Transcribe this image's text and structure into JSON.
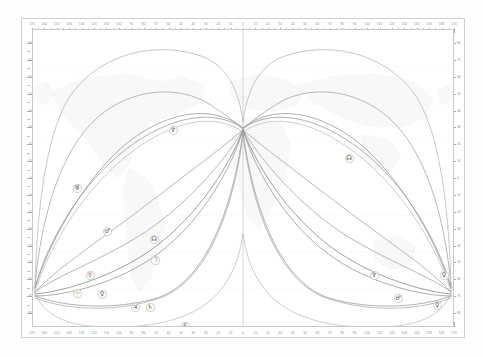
{
  "chart": {
    "type": "astrocartography-map",
    "projection": "equirectangular"
  },
  "axes": {
    "x_label_unit": "degrees longitude",
    "y_label_unit": "degrees latitude",
    "longitude_ticks": [
      "170",
      "160",
      "150",
      "140",
      "130",
      "120",
      "110",
      "100",
      "90",
      "80",
      "70",
      "60",
      "50",
      "40",
      "30",
      "20",
      "10",
      "0",
      "10",
      "20",
      "30",
      "40",
      "50",
      "60",
      "70",
      "80",
      "90",
      "100",
      "110",
      "120",
      "130",
      "140",
      "150",
      "160",
      "170"
    ],
    "latitude_ticks": [
      "80",
      "70",
      "60",
      "50",
      "40",
      "30",
      "20",
      "10",
      "0",
      "10",
      "20",
      "30",
      "40",
      "50",
      "60",
      "70",
      "80"
    ],
    "center_meridian": "0"
  },
  "side_captions": {
    "left": "",
    "bottom_left": ""
  },
  "planets": [
    {
      "key": "sun",
      "name": "Sun",
      "glyph": "☉",
      "color": "#8a8a8a"
    },
    {
      "key": "moon",
      "name": "Moon",
      "glyph": "☽",
      "color": "#9a9a9a"
    },
    {
      "key": "mercury",
      "name": "Mercury",
      "glyph": "☿",
      "color": "#909090"
    },
    {
      "key": "venus",
      "name": "Venus",
      "glyph": "♀",
      "color": "#8e8e8e"
    },
    {
      "key": "mars",
      "name": "Mars",
      "glyph": "♂",
      "color": "#8b8b8b"
    },
    {
      "key": "jupiter",
      "name": "Jupiter",
      "glyph": "♃",
      "color": "#949494"
    },
    {
      "key": "saturn",
      "name": "Saturn",
      "glyph": "♄",
      "color": "#8f8f8f"
    },
    {
      "key": "uranus",
      "name": "Uranus",
      "glyph": "♅",
      "color": "#a2a2a2"
    },
    {
      "key": "neptune",
      "name": "Neptune",
      "glyph": "♆",
      "color": "#999999"
    },
    {
      "key": "pluto",
      "name": "Pluto",
      "glyph": "♇",
      "color": "#a6a6a6"
    },
    {
      "key": "node",
      "name": "North Node",
      "glyph": "☊",
      "color": "#979797"
    }
  ],
  "markers": [
    {
      "id": "m01",
      "planet": "Neptune",
      "glyph": "♆",
      "x": 140,
      "y": 100,
      "side": "west"
    },
    {
      "id": "m02",
      "planet": "Uranus",
      "glyph": "♅",
      "x": 44,
      "y": 158,
      "side": "west"
    },
    {
      "id": "m03",
      "planet": "Mars",
      "glyph": "♂",
      "x": 74,
      "y": 201,
      "side": "west"
    },
    {
      "id": "m04",
      "planet": "North Node",
      "glyph": "☊",
      "x": 121,
      "y": 209,
      "side": "west"
    },
    {
      "id": "m05",
      "planet": "Moon",
      "glyph": "☽",
      "x": 122,
      "y": 230,
      "side": "west"
    },
    {
      "id": "m06",
      "planet": "Mercury",
      "glyph": "☿",
      "x": 57,
      "y": 245,
      "side": "west"
    },
    {
      "id": "m07",
      "planet": "Sun",
      "glyph": "☉",
      "x": 44,
      "y": 263,
      "side": "west"
    },
    {
      "id": "m08",
      "planet": "Venus",
      "glyph": "♀",
      "x": 69,
      "y": 264,
      "side": "west"
    },
    {
      "id": "m09",
      "planet": "Jupiter",
      "glyph": "♃",
      "x": 102,
      "y": 277,
      "side": "west"
    },
    {
      "id": "m10",
      "planet": "Saturn",
      "glyph": "♄",
      "x": 117,
      "y": 277,
      "side": "west"
    },
    {
      "id": "m11",
      "planet": "Pluto",
      "glyph": "♇",
      "x": 152,
      "y": 296,
      "side": "west"
    },
    {
      "id": "m12",
      "planet": "North Node",
      "glyph": "☊",
      "x": 316,
      "y": 128,
      "side": "east"
    },
    {
      "id": "m13",
      "planet": "Pluto",
      "glyph": "♇",
      "x": 436,
      "y": 181,
      "side": "east"
    },
    {
      "id": "m14",
      "planet": "Saturn",
      "glyph": "♄",
      "x": 432,
      "y": 229,
      "side": "east"
    },
    {
      "id": "m15",
      "planet": "Jupiter",
      "glyph": "♃",
      "x": 434,
      "y": 240,
      "side": "east"
    },
    {
      "id": "m16",
      "planet": "Neptune",
      "glyph": "♆",
      "x": 341,
      "y": 245,
      "side": "east"
    },
    {
      "id": "m17",
      "planet": "Venus",
      "glyph": "♀",
      "x": 411,
      "y": 245,
      "side": "east"
    },
    {
      "id": "m18",
      "planet": "Mercury",
      "glyph": "☿",
      "x": 428,
      "y": 263,
      "side": "east"
    },
    {
      "id": "m19",
      "planet": "Sun",
      "glyph": "☉",
      "x": 439,
      "y": 263,
      "side": "east"
    },
    {
      "id": "m20",
      "planet": "Mars",
      "glyph": "♂",
      "x": 365,
      "y": 268,
      "side": "east"
    },
    {
      "id": "m21",
      "planet": "Venus",
      "glyph": "♀",
      "x": 404,
      "y": 275,
      "side": "east"
    },
    {
      "id": "m22",
      "planet": "Uranus",
      "glyph": "♅",
      "x": 312,
      "y": 304,
      "side": "east"
    }
  ],
  "colors": {
    "background": "#ffffff",
    "frame": "#cfcfcf",
    "grid": "#ededed",
    "landmass": "#f3f3f3",
    "meridian": "#bdbdbd",
    "tick_text": "#8d8d8d"
  }
}
